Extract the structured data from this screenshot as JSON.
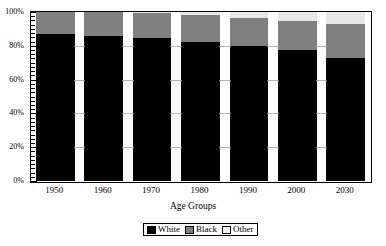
{
  "chart_data": {
    "type": "bar",
    "subtype": "stacked-percent",
    "title": "",
    "xlabel": "Age Groups",
    "ylabel": "",
    "categories": [
      "1950",
      "1960",
      "1970",
      "1980",
      "1990",
      "2000",
      "2030"
    ],
    "ylim": [
      0,
      100
    ],
    "ytick_labels": [
      "0%",
      "20%",
      "40%",
      "60%",
      "80%",
      "100%"
    ],
    "ytick_values": [
      0,
      20,
      40,
      60,
      80,
      100
    ],
    "grid": false,
    "minor_ticks": true,
    "legend_position": "bottom-center",
    "series": [
      {
        "name": "White",
        "color": "#000000",
        "values": [
          87.0,
          86.0,
          84.5,
          82.0,
          80.0,
          77.5,
          72.5
        ]
      },
      {
        "name": "Black",
        "color": "#808080",
        "values": [
          13.0,
          14.0,
          15.0,
          16.5,
          16.5,
          17.0,
          20.5
        ]
      },
      {
        "name": "Other",
        "color": "#e8e8e8",
        "values": [
          0.0,
          0.0,
          0.5,
          1.5,
          3.5,
          5.5,
          7.0
        ]
      }
    ]
  },
  "legend": {
    "items": [
      {
        "label": "White",
        "swatch": "black-swatch"
      },
      {
        "label": "Black",
        "swatch": "gray-swatch"
      },
      {
        "label": "Other",
        "swatch": "light-gray-swatch"
      }
    ]
  },
  "axis": {
    "x_title": "Age Groups"
  }
}
